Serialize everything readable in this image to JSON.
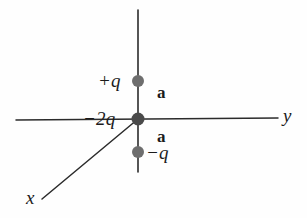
{
  "figure": {
    "background_color": "#fefefe",
    "line_color": "#2b2b2b",
    "charge_dot_color": "#6e6e6e",
    "text_color": "#1b1b1b"
  },
  "axes": {
    "vertical": {
      "name": "z-axis-line",
      "label": ""
    },
    "horizontal": {
      "name": "y-axis-line",
      "label": "y"
    },
    "diagonal": {
      "name": "x-axis-line",
      "label": "x"
    }
  },
  "labels": {
    "positive_charge": "+q",
    "center_charge": "−2q",
    "negative_charge": "−q",
    "distance_upper": "a",
    "distance_lower": "a",
    "axis_y": "y",
    "axis_x": "x"
  },
  "charges": [
    {
      "name": "charge-plus-q",
      "label": "+q",
      "x": 138,
      "y": 81,
      "radius": 6.0
    },
    {
      "name": "charge-minus-2q",
      "label": "−2q",
      "x": 138,
      "y": 119,
      "radius": 6.5
    },
    {
      "name": "charge-minus-q",
      "label": "−q",
      "x": 138,
      "y": 152,
      "radius": 6.0
    }
  ]
}
